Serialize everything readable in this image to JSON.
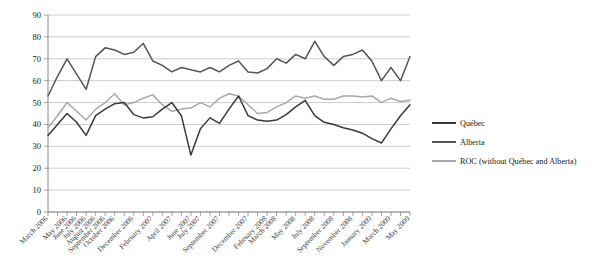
{
  "chart_data": {
    "type": "line",
    "title": "",
    "xlabel": "",
    "ylabel": "",
    "ylim": [
      0,
      90
    ],
    "ytick_values": [
      0,
      10,
      20,
      30,
      40,
      50,
      60,
      70,
      80,
      90
    ],
    "grid": true,
    "legend_position": "right",
    "categories": [
      "March 2006",
      "April 2006",
      "May 2006",
      "June 2006",
      "July 2006",
      "August 2006",
      "September 2006",
      "October 2006",
      "November 2006",
      "December 2006",
      "January 2007",
      "February 2007",
      "March 2007",
      "April 2007",
      "May 2007",
      "June 2007",
      "July 2007",
      "August 2007",
      "September 2007",
      "October 2007",
      "November 2007",
      "December 2007",
      "January 2008",
      "February 2008",
      "March 2008",
      "April 2008",
      "May 2008",
      "June 2008",
      "July 2008",
      "August 2008",
      "September 2008",
      "October 2008",
      "November 2008",
      "December 2008",
      "January 2009",
      "February 2009",
      "March 2009",
      "April 2009",
      "May 2009"
    ],
    "xtick_labels_shown": [
      "March 2006",
      "May 2006",
      "June 2006",
      "July 2006",
      "August 2006",
      "September 2006",
      "October 2006",
      "December 2006",
      "February 2007",
      "April 2007",
      "June 2007",
      "July 2007",
      "September 2007",
      "December 2007",
      "February 2008",
      "March 2008",
      "May 2008",
      "July 2008",
      "September 2008",
      "November 2008",
      "January 2009",
      "March 2009",
      "May 2009"
    ],
    "series": [
      {
        "name": "Québec",
        "color": "#3a3a3a",
        "values": [
          35,
          40,
          45,
          41,
          35,
          44,
          47,
          49.5,
          50,
          44.5,
          43,
          43.5,
          47,
          50,
          44,
          26,
          38,
          43,
          40.5,
          47,
          53,
          44,
          42,
          41.5,
          42,
          44.5,
          48,
          51,
          44,
          41,
          40,
          38.5,
          37.5,
          36,
          33.5,
          31.5,
          38,
          44,
          49
        ]
      },
      {
        "name": "Alberta",
        "color": "#555555",
        "values": [
          53,
          62,
          70,
          63,
          56,
          71,
          75,
          74,
          72,
          73,
          77,
          69,
          67,
          64,
          66,
          65,
          64,
          66,
          64,
          67,
          69,
          64,
          63.5,
          65.5,
          70,
          68,
          72,
          70,
          78,
          71,
          67,
          71,
          72,
          74,
          69,
          60,
          66,
          60,
          71
        ]
      },
      {
        "name": "ROC (without Québec and Alberta)",
        "color": "#a8a8a8",
        "values": [
          38.5,
          44,
          50,
          46,
          42,
          47,
          50,
          54,
          49,
          50,
          52,
          53.5,
          49,
          46,
          47,
          47.5,
          50,
          48,
          52,
          54,
          53,
          49,
          45,
          45.5,
          48,
          50,
          53,
          52,
          53,
          51.5,
          51.5,
          53,
          53,
          52.5,
          53,
          50,
          52,
          50.5,
          51
        ]
      }
    ],
    "legend": [
      {
        "label": "Québec",
        "color": "#3a3a3a"
      },
      {
        "label": "Alberta",
        "color": "#555555"
      },
      {
        "label": "ROC (without Québec and Alberta)",
        "color": "#a8a8a8"
      }
    ]
  },
  "colors": {
    "grid": "#b9b9b9",
    "axis": "#7d7d7d",
    "background": "#ffffff"
  }
}
